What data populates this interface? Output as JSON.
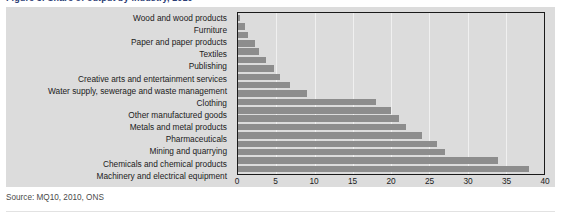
{
  "figure": {
    "cutoff_heading": "Figure 3: Share of output by industry, 2010",
    "source_note": "Source: MQ10, 2010, ONS"
  },
  "colors": {
    "bar": "#8d8d8d",
    "panel_background": "#dcdcdc",
    "plot_border": "#1a1a1a",
    "gridline": "#f0f0f0",
    "text": "#1b1b1b",
    "source_text": "#4a4a4a"
  },
  "chart_data": {
    "type": "bar",
    "orientation": "horizontal",
    "title": "",
    "xlabel": "",
    "ylabel": "",
    "xlim": [
      0,
      40
    ],
    "xticks": [
      0,
      5,
      10,
      15,
      20,
      25,
      30,
      35,
      40
    ],
    "xtick_labels": [
      "0",
      "5",
      "10",
      "15",
      "20",
      "25",
      "30",
      "35",
      "40"
    ],
    "grid": true,
    "grid_axis": "x",
    "legend": false,
    "categories": [
      "Wood and wood products",
      "Furniture",
      "Paper and paper products",
      "Textiles",
      "Publishing",
      "Creative arts and entertainment services",
      "Water supply, sewerage and waste management",
      "Clothing",
      "Other manufactured goods",
      "Metals and metal products",
      "Pharmaceuticals",
      "Mining and quarrying",
      "Chemicals and chemical products",
      "Machinery and electrical equipment"
    ],
    "values": [
      0.3,
      0.9,
      1.3,
      2.2,
      2.8,
      3.6,
      4.7,
      5.5,
      6.8,
      9.0,
      18.0,
      20.0,
      21.0,
      22.0
    ],
    "bars": [
      {
        "label": "Wood and wood products",
        "value": 0.3
      },
      {
        "label": "Furniture",
        "value": 0.9
      },
      {
        "label": "Paper and paper products",
        "value": 1.3
      },
      {
        "label": "Textiles",
        "value": 2.2
      },
      {
        "label": "Publishing",
        "value": 2.8
      },
      {
        "label": "Creative arts and entertainment services",
        "value": 3.6
      },
      {
        "label": "Water supply, sewerage and waste management",
        "value": 4.7
      },
      {
        "label": "Clothing",
        "value": 5.5
      },
      {
        "label": "Other manufactured goods",
        "value": 6.8
      },
      {
        "label": "Metals and metal products",
        "value": 9.0
      },
      {
        "label": "Pharmaceuticals",
        "value": 18.0
      },
      {
        "label": "Mining and quarrying",
        "value": 20.0
      },
      {
        "label": "Chemicals and chemical products",
        "value": 21.0
      },
      {
        "label": "Machinery and electrical equipment",
        "value": 22.0
      }
    ],
    "row_values_rendered": [
      0.3,
      0.9,
      1.3,
      2.2,
      2.8,
      3.6,
      4.7,
      5.5,
      6.8,
      9.0,
      18.0,
      20.0,
      21.0,
      22.0,
      24.0,
      26.0,
      27.0,
      34.0,
      38.0
    ]
  }
}
